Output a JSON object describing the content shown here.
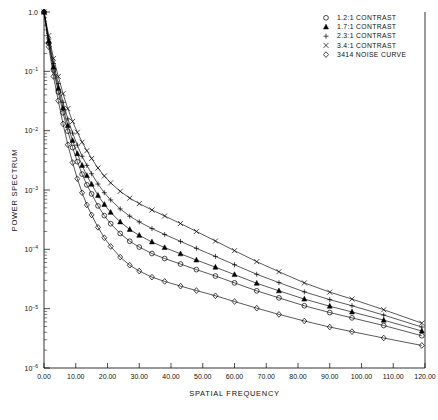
{
  "chart_data": {
    "type": "line",
    "title": "",
    "xlabel": "SPATIAL FREQUENCY",
    "ylabel": "POWER SPECTRUM",
    "xlim": [
      0,
      120
    ],
    "ylim": [
      1e-06,
      1.0
    ],
    "yscale": "log",
    "xscale": "linear",
    "grid": false,
    "legend_position": "top-right",
    "xticklabels": [
      "0.00",
      "10.00",
      "20.00",
      "30.00",
      "40.00",
      "50.00",
      "60.00",
      "70.00",
      "80.00",
      "90.00",
      "100.00",
      "110.00",
      "120.00"
    ],
    "xticks": [
      0,
      10,
      20,
      30,
      40,
      50,
      60,
      70,
      80,
      90,
      100,
      110,
      120
    ],
    "yticks": [
      1.0,
      0.1,
      0.01,
      0.001,
      0.0001,
      1e-05,
      1e-06
    ],
    "yticklabels": [
      "1.0",
      "10-1",
      "10-2",
      "10-3",
      "10-4",
      "10-5",
      "10-6"
    ],
    "series": [
      {
        "name": "1.2:1 CONTRAST",
        "marker": "circle",
        "x": [
          0,
          1.5,
          3,
          4.5,
          6,
          7.5,
          9,
          10.5,
          12,
          13.5,
          15,
          17,
          19,
          21,
          24,
          27,
          30,
          34,
          38,
          43,
          48,
          54,
          60,
          67,
          74,
          82,
          90,
          97,
          107,
          119
        ],
        "y": [
          1.0,
          0.3,
          0.105,
          0.045,
          0.02,
          0.0098,
          0.0052,
          0.003,
          0.00185,
          0.00122,
          0.00086,
          0.00054,
          0.00037,
          0.00027,
          0.000185,
          0.000137,
          0.000109,
          8.5e-05,
          7e-05,
          5.65e-05,
          4.55e-05,
          3.55e-05,
          2.72e-05,
          2e-05,
          1.52e-05,
          1.12e-05,
          8.6e-06,
          7e-06,
          5.2e-06,
          3.5e-06
        ]
      },
      {
        "name": "1.7:1 CONTRAST",
        "marker": "triangle",
        "x": [
          0,
          1.5,
          3,
          4.5,
          6,
          7.5,
          9,
          10.5,
          12,
          13.5,
          15,
          17,
          19,
          21,
          24,
          27,
          30,
          34,
          38,
          43,
          48,
          54,
          60,
          67,
          74,
          82,
          90,
          97,
          107,
          119
        ],
        "y": [
          1.0,
          0.32,
          0.118,
          0.052,
          0.024,
          0.0122,
          0.0068,
          0.0041,
          0.0026,
          0.00175,
          0.00125,
          0.00081,
          0.00057,
          0.00042,
          0.00029,
          0.000216,
          0.000172,
          0.000133,
          0.000107,
          8.4e-05,
          6.6e-05,
          5e-05,
          3.75e-05,
          2.68e-05,
          2e-05,
          1.45e-05,
          1.1e-05,
          8.8e-06,
          6.4e-06,
          4.2e-06
        ]
      },
      {
        "name": "2.3:1 CONTRAST",
        "marker": "plus",
        "x": [
          0,
          1.5,
          3,
          4.5,
          6,
          7.5,
          9,
          10.5,
          12,
          13.5,
          15,
          17,
          19,
          21,
          24,
          27,
          30,
          34,
          38,
          43,
          48,
          54,
          60,
          67,
          74,
          82,
          90,
          97,
          107,
          119
        ],
        "y": [
          1.0,
          0.35,
          0.135,
          0.062,
          0.03,
          0.0158,
          0.0091,
          0.0057,
          0.0037,
          0.0026,
          0.00188,
          0.00126,
          0.0009,
          0.00068,
          0.00048,
          0.000362,
          0.00029,
          0.000224,
          0.000178,
          0.000136,
          0.000104,
          7.6e-05,
          5.5e-05,
          3.8e-05,
          2.75e-05,
          1.92e-05,
          1.42e-05,
          1.12e-05,
          7.8e-06,
          4.9e-06
        ]
      },
      {
        "name": "3.4:1 CONTRAST",
        "marker": "x",
        "x": [
          0,
          1.5,
          3,
          4.5,
          6,
          7.5,
          9,
          10.5,
          12,
          13.5,
          15,
          17,
          19,
          21,
          24,
          27,
          30,
          34,
          38,
          43,
          48,
          54,
          60,
          67,
          74,
          82,
          90,
          97,
          107,
          119
        ],
        "y": [
          1.0,
          0.4,
          0.165,
          0.082,
          0.042,
          0.0235,
          0.0143,
          0.0094,
          0.0064,
          0.0046,
          0.0034,
          0.00235,
          0.00172,
          0.00132,
          0.00095,
          0.00073,
          0.00059,
          0.00046,
          0.000365,
          0.000272,
          0.0002,
          0.000138,
          9.5e-05,
          6.2e-05,
          4.2e-05,
          2.72e-05,
          1.9e-05,
          1.45e-05,
          9.6e-06,
          5.7e-06
        ]
      },
      {
        "name": "3414 NOISE CURVE",
        "marker": "diamond",
        "x": [
          0,
          1.5,
          3,
          4.5,
          6,
          7.5,
          9,
          10.5,
          12,
          13.5,
          15,
          17,
          19,
          21,
          24,
          27,
          30,
          34,
          38,
          43,
          48,
          54,
          60,
          67,
          74,
          82,
          90,
          97,
          107,
          119
        ],
        "y": [
          1.0,
          0.26,
          0.082,
          0.032,
          0.013,
          0.0058,
          0.0029,
          0.00155,
          0.0009,
          0.00056,
          0.00038,
          0.000235,
          0.000157,
          0.000112,
          7.4e-05,
          5.4e-05,
          4.3e-05,
          3.4e-05,
          2.88e-05,
          2.4e-05,
          2.02e-05,
          1.65e-05,
          1.32e-05,
          1.02e-05,
          8e-06,
          6.2e-06,
          4.9e-06,
          4.1e-06,
          3.2e-06,
          2.4e-06
        ]
      }
    ]
  },
  "legend": {
    "entries": [
      {
        "marker": "circle",
        "label": "1.2:1 CONTRAST"
      },
      {
        "marker": "triangle",
        "label": "1.7:1 CONTRAST"
      },
      {
        "marker": "plus",
        "label": "2.3:1 CONTRAST"
      },
      {
        "marker": "x",
        "label": "3.4:1 CONTRAST"
      },
      {
        "marker": "diamond",
        "label": "3414 NOISE CURVE"
      }
    ]
  },
  "colors": {
    "ink": "#000000",
    "background": "#ffffff"
  }
}
